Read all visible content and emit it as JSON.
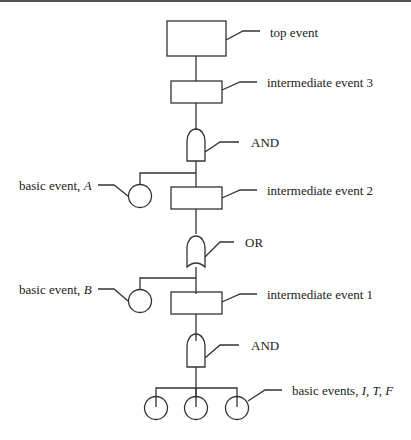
{
  "diagram": {
    "type": "fault-tree",
    "labels": {
      "top_event": "top event",
      "intermediate_event_3": "intermediate event 3",
      "gate_and_1": "AND",
      "basic_event_a_prefix": "basic event, ",
      "basic_event_a_var": "A",
      "intermediate_event_2": "intermediate event 2",
      "gate_or": "OR",
      "basic_event_b_prefix": "basic event, ",
      "basic_event_b_var": "B",
      "intermediate_event_1": "intermediate event 1",
      "gate_and_2": "AND",
      "basic_events_prefix": "basic events, ",
      "basic_events_vars": "I, T, F"
    },
    "colors": {
      "stroke": "#333333",
      "text": "#222222",
      "background": "#ffffff"
    }
  }
}
